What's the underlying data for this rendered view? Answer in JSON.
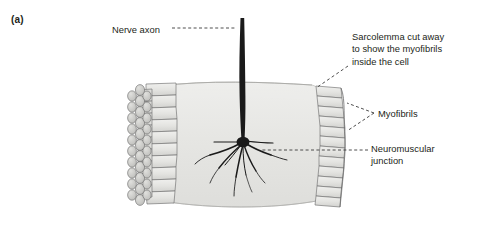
{
  "figure": {
    "panel_letter": "(a)",
    "background_color": "#ffffff"
  },
  "labels": {
    "nerve_axon": "Nerve axon",
    "sarcolemma": "Sarcolemma cut away\nto show the myofibrils\ninside the cell",
    "myofibrils": "Myofibrils",
    "neuromuscular_junction": "Neuromuscular\njunction"
  },
  "colors": {
    "text": "#231f20",
    "leader_line": "#3a3a3a",
    "cell_body_fill": "#e8e8e6",
    "cell_body_shade": "#dcdcd9",
    "myofibril_fill": "#e2e2e0",
    "myofibril_stroke": "#6e6e6e",
    "cut_end_fill": "#c9c9c6",
    "axon_color": "#1a1a1a"
  },
  "structures": [
    {
      "name": "nerve-axon",
      "description": "dark vertical nerve fibre entering cell from above"
    },
    {
      "name": "axon-terminal-branches",
      "description": "root-like branching terminals inside the muscle cell"
    },
    {
      "name": "muscle-cell-body",
      "description": "pale grey sarcoplasm block"
    },
    {
      "name": "myofibril-bundle-left",
      "description": "cut ends of myofibrils shown as circles with cylinders"
    },
    {
      "name": "myofibril-bundle-right",
      "description": "stacked myofibril segments at right edge"
    }
  ]
}
